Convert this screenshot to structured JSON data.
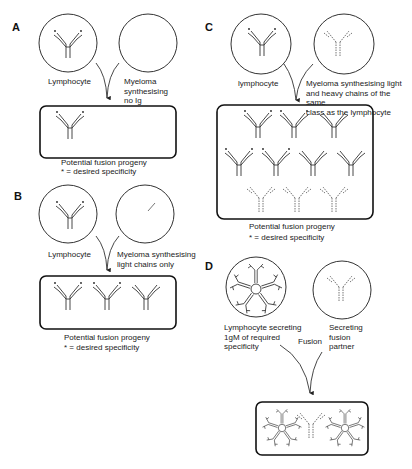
{
  "panels": {
    "A": {
      "letter": "A",
      "left_cell": "Lymphocyte",
      "right_cell": "Myeloma\nsynthesising\nno Ig",
      "caption_line1": "Potential fusion progeny",
      "caption_line2": "* = desired specificity"
    },
    "B": {
      "letter": "B",
      "left_cell": "Lymphocyte",
      "right_cell": "Myeloma synthesising\nlight chains only",
      "caption_line1": "Potential fusion progeny",
      "caption_line2": "* = desired specificity"
    },
    "C": {
      "letter": "C",
      "left_cell": "lymphocyte",
      "right_cell": "Myeloma synthesising light\nand heavy chains of the same\nclass as the lymphocyte",
      "caption_line1": "Potential fusion progeny",
      "caption_line2": "* = desired specificity"
    },
    "D": {
      "letter": "D",
      "left_cell": "Lymphocyte secreting\n1gM of required\nspecificity",
      "right_cell": "Secreting\nfusion\npartner",
      "arrow_label": "Fusion"
    }
  },
  "colors": {
    "line": "#333333",
    "dashed": "#777777"
  }
}
